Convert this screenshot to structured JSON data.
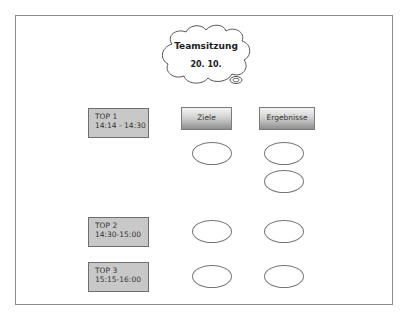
{
  "cloud": {
    "title": "Teamsitzung",
    "date": "20. 10."
  },
  "columns": [
    {
      "label": "Ziele"
    },
    {
      "label": "Ergebnisse"
    }
  ],
  "topics": [
    {
      "label": "TOP 1",
      "time": "14:14 - 14:30",
      "ziele_ovals": 1,
      "ergebnisse_ovals": 2
    },
    {
      "label": "TOP 2",
      "time": "14:30-15:00",
      "ziele_ovals": 1,
      "ergebnisse_ovals": 1
    },
    {
      "label": "TOP 3",
      "time": "15:15-16:00",
      "ziele_ovals": 1,
      "ergebnisse_ovals": 1
    }
  ],
  "colors": {
    "box_fill": "#c8c8c8",
    "border": "#777777"
  }
}
